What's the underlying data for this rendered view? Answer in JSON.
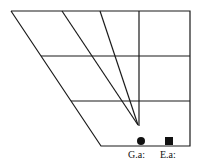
{
  "diagram": {
    "stroke_color": "#1a1a1a",
    "outline": [
      [
        11,
        11
      ],
      [
        190,
        11
      ],
      [
        190,
        146
      ],
      [
        101,
        146
      ]
    ],
    "horizontal_lines": [
      {
        "y": 56,
        "x1": 41,
        "x2": 190
      },
      {
        "y": 101,
        "x1": 71,
        "x2": 190
      }
    ],
    "vertical_line": {
      "x": 139,
      "y1": 11,
      "y2": 126
    },
    "rays": [
      {
        "from": [
          62,
          11
        ],
        "to": [
          138,
          125
        ]
      },
      {
        "from": [
          100,
          11
        ],
        "to": [
          138,
          125
        ]
      }
    ],
    "convergence_point": [
      138,
      125
    ],
    "markers": [
      {
        "shape": "circle",
        "x": 141,
        "y": 141,
        "label": "G.a:"
      },
      {
        "shape": "square",
        "x": 169,
        "y": 141,
        "label": "E.a:"
      }
    ]
  },
  "labels": {
    "g_label": "G.a:",
    "e_label": "E.a:"
  }
}
